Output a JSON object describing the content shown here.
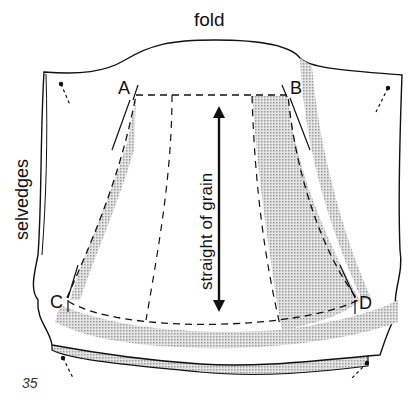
{
  "figure": {
    "number": "35",
    "labels": {
      "top": "fold",
      "left": "selvedges",
      "center": "straight of grain"
    },
    "points": [
      "A",
      "B",
      "C",
      "D"
    ]
  },
  "colors": {
    "ink": "#111111",
    "shade": "#c8c8c8",
    "paper": "#ffffff"
  }
}
